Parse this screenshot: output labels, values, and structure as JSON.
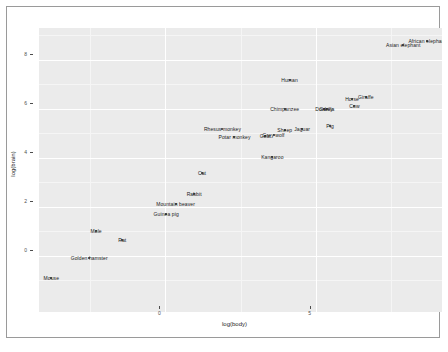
{
  "figure": {
    "title": "",
    "xlabel": "log(body)",
    "ylabel": "log(brain)",
    "panel_color": "#ebebeb",
    "grid_color": "#ffffff",
    "point_color": "#2b2b2b",
    "label_color": "#1a1a1a",
    "frame_color": "#9a9a9a"
  },
  "axes": {
    "x_ticks": [
      {
        "value": "0",
        "pos": 0
      },
      {
        "value": "5",
        "pos": 5
      }
    ],
    "y_ticks": [
      {
        "value": "8",
        "pos": 8
      },
      {
        "value": "6",
        "pos": 6
      },
      {
        "value": "4",
        "pos": 4
      },
      {
        "value": "2",
        "pos": 2
      },
      {
        "value": "0",
        "pos": 0
      }
    ],
    "xlim": [
      -4.2,
      9.2
    ],
    "ylim": [
      -2.3,
      9.3
    ]
  },
  "chart_data": {
    "type": "scatter",
    "title": "",
    "xlabel": "log(body)",
    "ylabel": "log(brain)",
    "xlim": [
      -4.2,
      9.2
    ],
    "ylim": [
      -2.3,
      9.3
    ],
    "grid": true,
    "legend": "none",
    "x_tick_labels": [
      "0",
      "5"
    ],
    "y_tick_labels": [
      "8",
      "6",
      "4",
      "2",
      "0"
    ],
    "points": [
      {
        "label": "African elephant",
        "x": 8.71,
        "y": 8.77
      },
      {
        "label": "Asian elephant",
        "x": 7.91,
        "y": 8.59
      },
      {
        "label": "Human",
        "x": 4.13,
        "y": 7.19
      },
      {
        "label": "Giraffe",
        "x": 6.67,
        "y": 6.47
      },
      {
        "label": "Horse",
        "x": 6.21,
        "y": 6.38
      },
      {
        "label": "Cow",
        "x": 6.29,
        "y": 6.1
      },
      {
        "label": "Donkey",
        "x": 5.28,
        "y": 6.01
      },
      {
        "label": "Gorilla",
        "x": 5.37,
        "y": 5.99
      },
      {
        "label": "Chimpanzee",
        "x": 3.97,
        "y": 5.99
      },
      {
        "label": "Pig",
        "x": 5.48,
        "y": 5.3
      },
      {
        "label": "Jaguar",
        "x": 4.55,
        "y": 5.19
      },
      {
        "label": "Sheep",
        "x": 3.97,
        "y": 5.14
      },
      {
        "label": "Grey wolf",
        "x": 3.6,
        "y": 4.94
      },
      {
        "label": "Goat",
        "x": 3.33,
        "y": 4.87
      },
      {
        "label": "Rhesus monkey",
        "x": 1.9,
        "y": 5.18
      },
      {
        "label": "Potar monkey",
        "x": 2.3,
        "y": 4.86
      },
      {
        "label": "Kangaroo",
        "x": 3.56,
        "y": 4.02
      },
      {
        "label": "Cat",
        "x": 1.22,
        "y": 3.37
      },
      {
        "label": "Rabbit",
        "x": 0.96,
        "y": 2.51
      },
      {
        "label": "Mountain beaver",
        "x": 0.34,
        "y": 2.13
      },
      {
        "label": "Guinea pig",
        "x": 0.03,
        "y": 1.72
      },
      {
        "label": "Mole",
        "x": -2.3,
        "y": 1.01
      },
      {
        "label": "Rat",
        "x": -1.43,
        "y": 0.64
      },
      {
        "label": "Golden hamster",
        "x": -2.53,
        "y": -0.11
      },
      {
        "label": "Mouse",
        "x": -3.79,
        "y": -0.92
      }
    ]
  }
}
